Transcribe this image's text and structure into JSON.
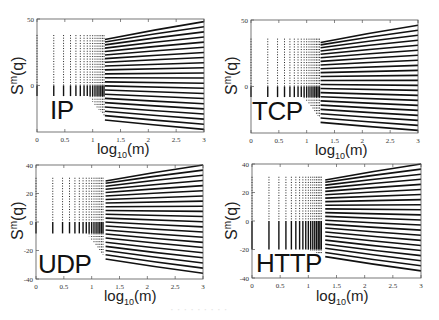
{
  "figure": {
    "caption": "· · · · · · · · ·",
    "xlabel_base": "log",
    "xlabel_sub": "10",
    "xlabel_tail": "(m)",
    "ylabel_base": "S",
    "ylabel_sup": "m",
    "ylabel_tail": "(q)"
  },
  "chart_data": [
    {
      "type": "scatter",
      "title": "IP",
      "xlabel": "log10(m)",
      "ylabel": "S^m(q)",
      "xlim": [
        0,
        3
      ],
      "ylim": [
        -35,
        50
      ],
      "xticks": [
        0,
        0.5,
        1,
        1.5,
        2,
        2.5,
        3
      ],
      "xtick_labels": [
        "0",
        "0.5",
        "1",
        "1.5",
        "2",
        "2.5",
        "3"
      ],
      "yticks": [
        50,
        0
      ],
      "ytick_labels": [
        "50",
        "0"
      ],
      "grid": false,
      "legend": "none",
      "series_count": 22,
      "lines_end_top": 48,
      "lines_end_bottom": -33,
      "lines_start_x": 1.22,
      "column_top": 38,
      "column_bottom": -8,
      "transition_x": 1.22,
      "transition_low": -26
    },
    {
      "type": "scatter",
      "title": "TCP",
      "xlabel": "log10(m)",
      "ylabel": "S^m(q)",
      "xlim": [
        0,
        3
      ],
      "ylim": [
        -35,
        50
      ],
      "xticks": [
        0,
        0.5,
        1,
        1.5,
        2,
        2.5,
        3
      ],
      "xtick_labels": [
        "0",
        "0.5",
        "1",
        "1.5",
        "2",
        "2.5",
        "3"
      ],
      "yticks": [
        50,
        0
      ],
      "ytick_labels": [
        "50",
        "0"
      ],
      "grid": false,
      "legend": "none",
      "series_count": 22,
      "lines_end_top": 46,
      "lines_end_bottom": -33,
      "lines_start_x": 1.25,
      "column_top": 36,
      "column_bottom": -8,
      "transition_x": 1.25,
      "transition_low": -27
    },
    {
      "type": "scatter",
      "title": "UDP",
      "xlabel": "log10(m)",
      "ylabel": "S^m(q)",
      "xlim": [
        0,
        3
      ],
      "ylim": [
        -40,
        40
      ],
      "xticks": [
        0,
        0.5,
        1,
        1.5,
        2,
        2.5,
        3
      ],
      "xtick_labels": [
        "0",
        "0.5",
        "1",
        "1.5",
        "2",
        "2.5",
        "3"
      ],
      "yticks": [
        40,
        20,
        0,
        -20,
        -40
      ],
      "ytick_labels": [
        "40",
        "20",
        "0",
        "-20",
        "-40"
      ],
      "grid": false,
      "legend": "none",
      "series_count": 22,
      "lines_end_top": 40,
      "lines_end_bottom": -36,
      "lines_start_x": 1.25,
      "column_top": 31,
      "column_bottom": -8,
      "transition_x": 1.22,
      "transition_low": -26
    },
    {
      "type": "scatter",
      "title": "HTTP",
      "xlabel": "log10(m)",
      "ylabel": "S^m(q)",
      "xlim": [
        0,
        3
      ],
      "ylim": [
        -40,
        40
      ],
      "xticks": [
        0,
        0.5,
        1,
        1.5,
        2,
        2.5,
        3
      ],
      "xtick_labels": [
        "0",
        "0.5",
        "1",
        "1.5",
        "2",
        "2.5",
        "3"
      ],
      "yticks": [
        40,
        20,
        0,
        -20,
        -40
      ],
      "ytick_labels": [
        "40",
        "20",
        "0",
        "-20",
        "-40"
      ],
      "grid": false,
      "legend": "none",
      "series_count": 22,
      "lines_end_top": 40,
      "lines_end_bottom": -35,
      "lines_start_x": 1.3,
      "column_top": 31,
      "column_bottom": -20,
      "transition_x": 1.3,
      "transition_low": -25
    }
  ],
  "panels": [
    {
      "label": "IP",
      "box": {
        "x": 37,
        "y": 19,
        "w": 167,
        "h": 113
      },
      "label_pos": {
        "x": 50,
        "y": 95
      },
      "xlabel_pos": {
        "x": 97,
        "y": 140
      },
      "ylabel_pos": {
        "x": 8,
        "y": 95
      }
    },
    {
      "label": "TCP",
      "box": {
        "x": 251,
        "y": 20,
        "w": 167,
        "h": 113
      },
      "label_pos": {
        "x": 252,
        "y": 96
      },
      "xlabel_pos": {
        "x": 315,
        "y": 141
      },
      "ylabel_pos": {
        "x": 222,
        "y": 95
      }
    },
    {
      "label": "UDP",
      "box": {
        "x": 36,
        "y": 165,
        "w": 167,
        "h": 114
      },
      "label_pos": {
        "x": 38,
        "y": 249
      },
      "xlabel_pos": {
        "x": 104,
        "y": 287
      },
      "ylabel_pos": {
        "x": 8,
        "y": 240
      }
    },
    {
      "label": "HTTP",
      "box": {
        "x": 252,
        "y": 164,
        "w": 169,
        "h": 114
      },
      "label_pos": {
        "x": 256,
        "y": 248
      },
      "xlabel_pos": {
        "x": 316,
        "y": 287
      },
      "ylabel_pos": {
        "x": 222,
        "y": 240
      }
    }
  ]
}
